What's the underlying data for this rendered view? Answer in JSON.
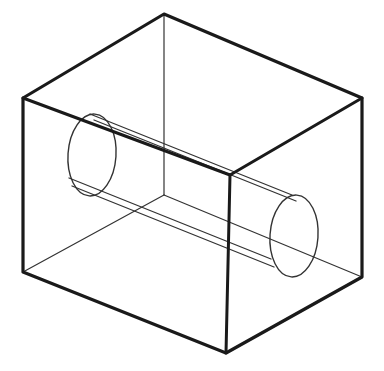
{
  "figure": {
    "type": "technical-line-drawing",
    "canvas": {
      "width": 384,
      "height": 371,
      "background": "#ffffff"
    },
    "colors": {
      "stroke_primary": "#1a1a1a",
      "stroke_secondary": "#333333",
      "background": "#ffffff"
    },
    "stroke_widths": {
      "silhouette": 3.2,
      "interior": 1.2,
      "cylinder": 1.3
    },
    "box": {
      "label": "rectangular prism",
      "vertices": {
        "top_back": [
          164,
          14
        ],
        "top_left": [
          23,
          98
        ],
        "top_right": [
          362,
          98
        ],
        "top_front": [
          230,
          175
        ],
        "bottom_left": [
          23,
          272
        ],
        "bottom_right": [
          362,
          277
        ],
        "bottom_front": [
          226,
          353
        ],
        "bottom_back_hidden": [
          164,
          195
        ]
      },
      "silhouette_path": "M 164 14 L 23 98 L 23 272 L 226 353 L 362 277 L 362 98 Z",
      "front_vertical_edge": {
        "from": [
          230,
          175
        ],
        "to": [
          226,
          353
        ]
      },
      "front_left_top_edge": {
        "from": [
          23,
          98
        ],
        "to": [
          230,
          175
        ]
      },
      "front_right_top_edge": {
        "from": [
          230,
          175
        ],
        "to": [
          362,
          98
        ]
      },
      "back_vertical_edge_hidden": {
        "from": [
          164,
          14
        ],
        "to": [
          164,
          195
        ]
      },
      "back_left_bottom_edge_hidden": {
        "from": [
          23,
          272
        ],
        "to": [
          164,
          195
        ]
      },
      "back_right_bottom_edge_hidden": {
        "from": [
          164,
          195
        ],
        "to": [
          362,
          277
        ]
      }
    },
    "cylinder": {
      "label": "cylindrical through-hole",
      "axis_direction": "left-upper to right-lower",
      "near_face_ellipse": {
        "name": "left-end-ellipse",
        "center": [
          92,
          155
        ],
        "rx": 24,
        "ry": 41,
        "rotation_deg": 4
      },
      "far_face_ellipse": {
        "name": "right-end-ellipse",
        "center": [
          294,
          236
        ],
        "rx": 24,
        "ry": 41,
        "rotation_deg": 4
      },
      "upper_wall_line": {
        "from": [
          90,
          114
        ],
        "to": [
          292,
          195
        ]
      },
      "lower_wall_line": {
        "from": [
          69,
          178
        ],
        "to": [
          271,
          259
        ]
      },
      "upper_wall_line_inner": {
        "from": [
          94,
          120
        ],
        "to": [
          296,
          201
        ]
      },
      "lower_wall_line_inner": {
        "from": [
          72,
          186
        ],
        "to": [
          274,
          267
        ]
      }
    }
  }
}
